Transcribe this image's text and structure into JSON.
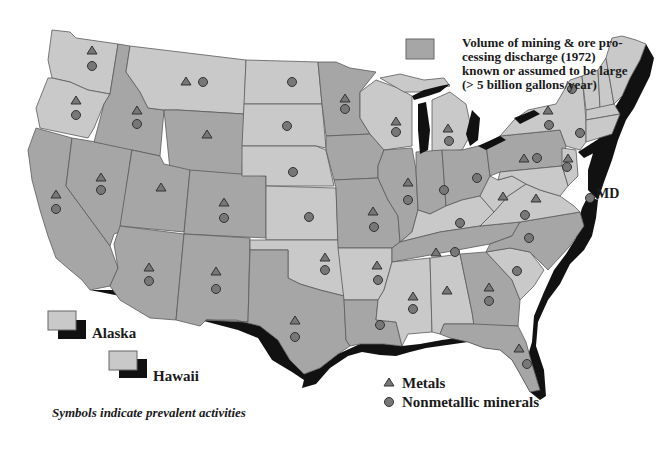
{
  "legend": {
    "shaded_box": {
      "description": "Volume of mining & ore processing discharge (1972) known or assumed to be large (> 5 billion gallons/year)",
      "lines": [
        "Volume of mining & ore pro-",
        "cessing discharge (1972)",
        "known or assumed to be large",
        "(> 5 billion gallons/year)"
      ],
      "color": "#a6a6a6"
    },
    "symbols": [
      {
        "shape": "triangle",
        "label": "Metals",
        "color": "#777777"
      },
      {
        "shape": "circle",
        "label": "Nonmetallic minerals",
        "color": "#777777"
      }
    ],
    "caption": "Symbols indicate prevalent activities"
  },
  "insets": {
    "alaska": {
      "label": "Alaska"
    },
    "hawaii": {
      "label": "Hawaii"
    }
  },
  "callout": {
    "label": "MD"
  },
  "colors": {
    "light_state": "#c9c9c9",
    "dark_state": "#a6a6a6",
    "coast": "#111111",
    "symbol": "#777777",
    "border": "#5a5a5a"
  },
  "states": [
    {
      "name": "WA",
      "shade": "light",
      "metals": true,
      "nonmetallic": true
    },
    {
      "name": "OR",
      "shade": "light",
      "metals": true,
      "nonmetallic": true
    },
    {
      "name": "CA",
      "shade": "dark",
      "metals": true,
      "nonmetallic": true
    },
    {
      "name": "ID",
      "shade": "dark",
      "metals": true,
      "nonmetallic": true
    },
    {
      "name": "NV",
      "shade": "dark",
      "metals": true,
      "nonmetallic": true
    },
    {
      "name": "MT",
      "shade": "light",
      "metals": true,
      "nonmetallic": true
    },
    {
      "name": "WY",
      "shade": "dark",
      "metals": true,
      "nonmetallic": false
    },
    {
      "name": "UT",
      "shade": "dark",
      "metals": true,
      "nonmetallic": false
    },
    {
      "name": "CO",
      "shade": "dark",
      "metals": true,
      "nonmetallic": true
    },
    {
      "name": "AZ",
      "shade": "dark",
      "metals": true,
      "nonmetallic": true
    },
    {
      "name": "NM",
      "shade": "dark",
      "metals": true,
      "nonmetallic": true
    },
    {
      "name": "ND",
      "shade": "light",
      "metals": false,
      "nonmetallic": true
    },
    {
      "name": "SD",
      "shade": "light",
      "metals": false,
      "nonmetallic": true
    },
    {
      "name": "NE",
      "shade": "light",
      "metals": false,
      "nonmetallic": true
    },
    {
      "name": "KS",
      "shade": "light",
      "metals": false,
      "nonmetallic": true
    },
    {
      "name": "OK",
      "shade": "light",
      "metals": true,
      "nonmetallic": true
    },
    {
      "name": "TX",
      "shade": "dark",
      "metals": true,
      "nonmetallic": true
    },
    {
      "name": "MN",
      "shade": "dark",
      "metals": true,
      "nonmetallic": true
    },
    {
      "name": "IA",
      "shade": "dark",
      "metals": false,
      "nonmetallic": false
    },
    {
      "name": "MO",
      "shade": "dark",
      "metals": true,
      "nonmetallic": true
    },
    {
      "name": "AR",
      "shade": "light",
      "metals": true,
      "nonmetallic": true
    },
    {
      "name": "LA",
      "shade": "dark",
      "metals": false,
      "nonmetallic": true
    },
    {
      "name": "WI",
      "shade": "light",
      "metals": true,
      "nonmetallic": true
    },
    {
      "name": "IL",
      "shade": "dark",
      "metals": true,
      "nonmetallic": true
    },
    {
      "name": "MI",
      "shade": "light",
      "metals": true,
      "nonmetallic": true
    },
    {
      "name": "IN",
      "shade": "dark",
      "metals": false,
      "nonmetallic": true
    },
    {
      "name": "OH",
      "shade": "dark",
      "metals": false,
      "nonmetallic": true
    },
    {
      "name": "KY",
      "shade": "light",
      "metals": false,
      "nonmetallic": true
    },
    {
      "name": "TN",
      "shade": "dark",
      "metals": true,
      "nonmetallic": true
    },
    {
      "name": "MS",
      "shade": "light",
      "metals": true,
      "nonmetallic": true
    },
    {
      "name": "AL",
      "shade": "light",
      "metals": true,
      "nonmetallic": false
    },
    {
      "name": "GA",
      "shade": "dark",
      "metals": true,
      "nonmetallic": true
    },
    {
      "name": "FL",
      "shade": "dark",
      "metals": true,
      "nonmetallic": true
    },
    {
      "name": "SC",
      "shade": "light",
      "metals": false,
      "nonmetallic": true
    },
    {
      "name": "NC",
      "shade": "dark",
      "metals": false,
      "nonmetallic": true
    },
    {
      "name": "VA",
      "shade": "light",
      "metals": true,
      "nonmetallic": true
    },
    {
      "name": "WV",
      "shade": "light",
      "metals": true,
      "nonmetallic": false
    },
    {
      "name": "PA",
      "shade": "dark",
      "metals": true,
      "nonmetallic": true
    },
    {
      "name": "NY",
      "shade": "light",
      "metals": true,
      "nonmetallic": true
    },
    {
      "name": "NJ",
      "shade": "light",
      "metals": true,
      "nonmetallic": true
    },
    {
      "name": "VT",
      "shade": "light",
      "metals": false,
      "nonmetallic": true
    },
    {
      "name": "NH",
      "shade": "light",
      "metals": false,
      "nonmetallic": false
    },
    {
      "name": "ME",
      "shade": "light",
      "metals": false,
      "nonmetallic": false
    },
    {
      "name": "MA",
      "shade": "light",
      "metals": false,
      "nonmetallic": false
    },
    {
      "name": "CT",
      "shade": "light",
      "metals": false,
      "nonmetallic": true
    },
    {
      "name": "MD",
      "shade": "light",
      "metals": false,
      "nonmetallic": true
    }
  ]
}
